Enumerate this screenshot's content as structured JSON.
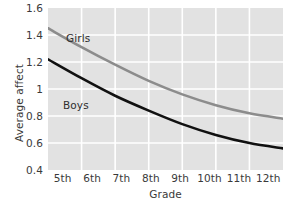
{
  "chart_data": {
    "type": "line",
    "title": "",
    "xlabel": "Grade",
    "ylabel": "Average affect",
    "categories": [
      "5th",
      "6th",
      "7th",
      "8th",
      "9th",
      "10th",
      "11th",
      "12th"
    ],
    "xlim": [
      0,
      7
    ],
    "ylim": [
      0.4,
      1.6
    ],
    "yticks": [
      "1.6",
      "1.4",
      "1.2",
      "1",
      "0.8",
      "0.6",
      "0.4"
    ],
    "ytick_values": [
      1.6,
      1.4,
      1.2,
      1.0,
      0.8,
      0.6,
      0.4
    ],
    "grid": true,
    "grid_color": "#ffffff",
    "plot_background": "#e2e2e2",
    "legend_position": "inline-annotation",
    "series": [
      {
        "name": "Girls",
        "color": "#8c8c8c",
        "values": [
          1.45,
          1.31,
          1.18,
          1.06,
          0.96,
          0.88,
          0.82,
          0.78
        ],
        "label_x_category": "6th",
        "label_y_value": 1.33
      },
      {
        "name": "Boys",
        "color": "#111111",
        "values": [
          1.22,
          1.08,
          0.95,
          0.84,
          0.74,
          0.66,
          0.6,
          0.56
        ],
        "label_x_category": "6th",
        "label_y_value": 0.85
      }
    ]
  }
}
